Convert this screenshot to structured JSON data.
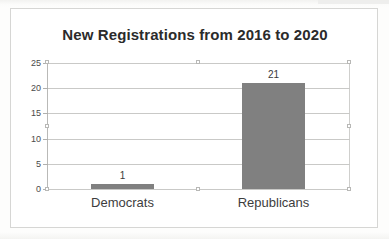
{
  "chart_data": {
    "type": "bar",
    "title": "New Registrations from 2016 to 2020",
    "categories": [
      "Democrats",
      "Republicans"
    ],
    "values": [
      1,
      21
    ],
    "data_labels": [
      "1",
      "21"
    ],
    "xlabel": "",
    "ylabel": "",
    "ylim": [
      0,
      25
    ],
    "yticks": [
      0,
      5,
      10,
      15,
      20,
      25
    ],
    "ytick_labels": [
      "0",
      "5",
      "10",
      "15",
      "20",
      "25"
    ],
    "grid": true,
    "legend": false,
    "bar_color": "#808080",
    "series": [
      {
        "name": "New Registrations",
        "values": [
          1,
          21
        ]
      }
    ]
  },
  "axis": {
    "y_ticks": [
      {
        "label": "25",
        "value": 25
      },
      {
        "label": "20",
        "value": 20
      },
      {
        "label": "15",
        "value": 15
      },
      {
        "label": "10",
        "value": 10
      },
      {
        "label": "5",
        "value": 5
      },
      {
        "label": "0",
        "value": 0
      }
    ]
  },
  "bars": [
    {
      "category": "Democrats",
      "label": "1",
      "value": 1
    },
    {
      "category": "Republicans",
      "label": "21",
      "value": 21
    }
  ]
}
